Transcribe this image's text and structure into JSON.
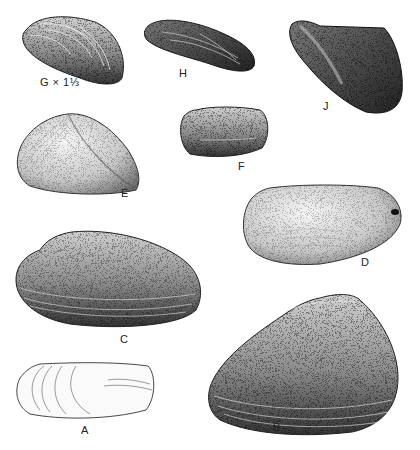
{
  "figure": {
    "type": "scientific-illustration",
    "ink_color": "#1a1a1a",
    "paper_color": "#ffffff",
    "specimens": [
      {
        "id": "G",
        "label": "G x 1⅓",
        "x": 22,
        "y": 15,
        "w": 105,
        "h": 70
      },
      {
        "id": "H",
        "label": "H",
        "x": 143,
        "y": 18,
        "w": 115,
        "h": 54
      },
      {
        "id": "J",
        "label": "J",
        "x": 287,
        "y": 20,
        "w": 118,
        "h": 95
      },
      {
        "id": "E",
        "label": "E",
        "x": 15,
        "y": 112,
        "w": 127,
        "h": 83
      },
      {
        "id": "F",
        "label": "F",
        "x": 181,
        "y": 107,
        "w": 87,
        "h": 51
      },
      {
        "id": "D",
        "label": "D",
        "x": 243,
        "y": 184,
        "w": 160,
        "h": 80
      },
      {
        "id": "C",
        "label": "C",
        "x": 15,
        "y": 228,
        "w": 186,
        "h": 100
      },
      {
        "id": "A",
        "label": "A",
        "x": 15,
        "y": 362,
        "w": 140,
        "h": 57
      },
      {
        "id": "B",
        "label": "B",
        "x": 208,
        "y": 293,
        "w": 192,
        "h": 140
      }
    ]
  },
  "labels": {
    "G": "G × 1⅓",
    "H": "H",
    "J": "J",
    "E": "E",
    "F": "F",
    "D": "D",
    "C": "C",
    "A": "A",
    "B": "B"
  }
}
